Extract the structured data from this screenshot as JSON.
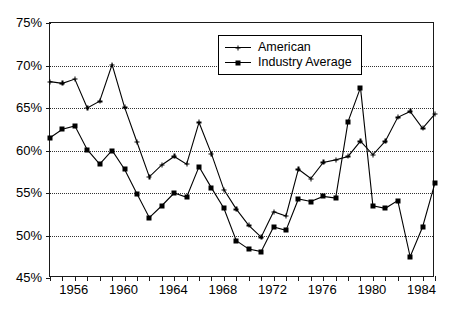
{
  "chart_data": {
    "type": "line",
    "title": "",
    "subtitle": "",
    "xlabel": "",
    "ylabel": "",
    "ylim": [
      45,
      75
    ],
    "xlim": [
      1954,
      1985
    ],
    "ytick_values": [
      45,
      50,
      55,
      60,
      65,
      70,
      75
    ],
    "ytick_labels": [
      "45%",
      "50%",
      "55%",
      "60%",
      "65%",
      "70%",
      "75%"
    ],
    "xtick_values": [
      1954,
      1955,
      1956,
      1957,
      1958,
      1959,
      1960,
      1961,
      1962,
      1963,
      1964,
      1965,
      1966,
      1967,
      1968,
      1969,
      1970,
      1971,
      1972,
      1973,
      1974,
      1975,
      1976,
      1977,
      1978,
      1979,
      1980,
      1981,
      1982,
      1983,
      1984,
      1985
    ],
    "xtick_labeled": [
      1956,
      1960,
      1964,
      1968,
      1972,
      1976,
      1980,
      1984
    ],
    "xtick_labels": [
      "1956",
      "1960",
      "1964",
      "1968",
      "1972",
      "1976",
      "1980",
      "1984"
    ],
    "grid": "horizontal-dotted",
    "grid_color": "#333333",
    "legend_position": "top-center",
    "series": [
      {
        "name": "American",
        "marker": "cross",
        "color": "#000000",
        "x": [
          1954,
          1955,
          1956,
          1957,
          1958,
          1959,
          1960,
          1961,
          1962,
          1963,
          1964,
          1965,
          1966,
          1967,
          1968,
          1969,
          1970,
          1971,
          1972,
          1973,
          1974,
          1975,
          1976,
          1977,
          1978,
          1979,
          1980,
          1981,
          1982,
          1983,
          1984,
          1985
        ],
        "values": [
          68.1,
          67.9,
          68.4,
          65.0,
          65.8,
          70.1,
          65.1,
          61.0,
          56.9,
          58.3,
          59.3,
          58.4,
          63.3,
          59.6,
          55.4,
          53.1,
          51.2,
          49.8,
          52.8,
          52.3,
          57.8,
          56.7,
          58.6,
          58.9,
          59.3,
          61.1,
          59.5,
          61.1,
          63.9,
          64.6,
          62.6,
          64.3
        ]
      },
      {
        "name": "Industry Average",
        "marker": "square",
        "color": "#000000",
        "x": [
          1954,
          1955,
          1956,
          1957,
          1958,
          1959,
          1960,
          1961,
          1962,
          1963,
          1964,
          1965,
          1966,
          1967,
          1968,
          1969,
          1970,
          1971,
          1972,
          1973,
          1974,
          1975,
          1976,
          1977,
          1978,
          1979,
          1980,
          1981,
          1982,
          1983,
          1984,
          1985
        ],
        "values": [
          61.5,
          62.5,
          62.9,
          60.1,
          58.4,
          60.0,
          57.8,
          54.9,
          52.1,
          53.5,
          55.0,
          54.5,
          58.1,
          55.6,
          53.2,
          49.4,
          48.4,
          48.1,
          51.0,
          50.6,
          54.3,
          54.0,
          54.6,
          54.4,
          63.4,
          67.4,
          53.5,
          53.2,
          54.1,
          47.5,
          51.0,
          56.2
        ]
      }
    ]
  },
  "legend": {
    "items": [
      {
        "label": "American",
        "marker": "cross"
      },
      {
        "label": "Industry Average",
        "marker": "square"
      }
    ]
  }
}
